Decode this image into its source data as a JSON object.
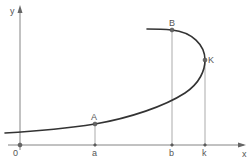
{
  "diagram": {
    "axes": {
      "x_label": "x",
      "y_label": "y",
      "origin_label": "0"
    },
    "points": [
      {
        "id": "A",
        "label": "A",
        "foot_label": "a"
      },
      {
        "id": "B",
        "label": "B",
        "foot_label": "b"
      },
      {
        "id": "K",
        "label": "K",
        "foot_label": "k"
      }
    ],
    "colors": {
      "curve": "#333333",
      "axis": "#777777",
      "guide": "#888888",
      "background": "#ffffff"
    }
  }
}
